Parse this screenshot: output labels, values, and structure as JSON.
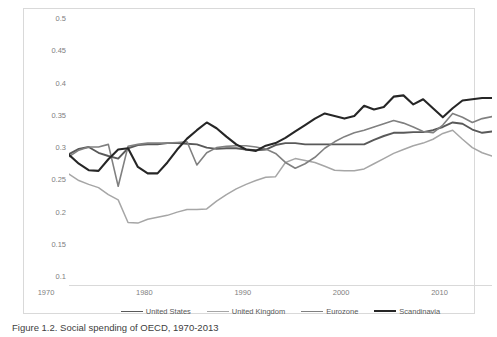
{
  "caption": "Figure 1.2. Social spending of OECD, 1970-2013",
  "legend": {
    "position": "bottom-center",
    "items": [
      {
        "label": "United States",
        "color": "#595959",
        "width": 1.9
      },
      {
        "label": "United Kingdom",
        "color": "#a6a6a6",
        "width": 1.5
      },
      {
        "label": "Eurozone",
        "color": "#808080",
        "width": 1.6
      },
      {
        "label": "Scandinavia",
        "color": "#262626",
        "width": 2.1
      }
    ]
  },
  "chart_data": {
    "type": "line",
    "title": "",
    "xlabel": "",
    "ylabel": "",
    "xlim": [
      1970,
      2013
    ],
    "ylim": [
      0.1,
      0.5
    ],
    "ytick_step": 0.05,
    "grid": false,
    "legend_position": "bottom-center",
    "ytick_labels": [
      "0.5",
      "0.45",
      "0.4",
      "0.35",
      "0.3",
      "0.25",
      "0.2",
      "0.15",
      "0.1"
    ],
    "ytick_values": [
      0.5,
      0.45,
      0.4,
      0.35,
      0.3,
      0.25,
      0.2,
      0.15,
      0.1
    ],
    "xtick_labels": [
      "1970",
      "1980",
      "1990",
      "2000",
      "2010"
    ],
    "xtick_values": [
      1970,
      1980,
      1990,
      2000,
      2010
    ],
    "x": [
      1970,
      1971,
      1972,
      1973,
      1974,
      1975,
      1976,
      1977,
      1978,
      1979,
      1980,
      1981,
      1982,
      1983,
      1984,
      1985,
      1986,
      1987,
      1988,
      1989,
      1990,
      1991,
      1992,
      1993,
      1994,
      1995,
      1996,
      1997,
      1998,
      1999,
      2000,
      2001,
      2002,
      2003,
      2004,
      2005,
      2006,
      2007,
      2008,
      2009,
      2010,
      2011,
      2012,
      2013
    ],
    "series": [
      {
        "name": "United States",
        "color": "#595959",
        "values": [
          0.303,
          0.311,
          0.314,
          0.305,
          0.3,
          0.296,
          0.312,
          0.317,
          0.318,
          0.318,
          0.32,
          0.32,
          0.319,
          0.318,
          0.313,
          0.311,
          0.312,
          0.312,
          0.31,
          0.309,
          0.31,
          0.317,
          0.32,
          0.32,
          0.318,
          0.318,
          0.318,
          0.318,
          0.318,
          0.318,
          0.318,
          0.325,
          0.331,
          0.336,
          0.336,
          0.337,
          0.337,
          0.34,
          0.345,
          0.352,
          0.35,
          0.341,
          0.336,
          0.338
        ]
      },
      {
        "name": "United Kingdom",
        "color": "#a6a6a6",
        "values": [
          0.272,
          0.262,
          0.256,
          0.251,
          0.24,
          0.232,
          0.197,
          0.196,
          0.202,
          0.205,
          0.208,
          0.213,
          0.217,
          0.217,
          0.218,
          0.23,
          0.24,
          0.249,
          0.256,
          0.262,
          0.267,
          0.268,
          0.29,
          0.296,
          0.293,
          0.29,
          0.284,
          0.278,
          0.277,
          0.277,
          0.28,
          0.288,
          0.296,
          0.304,
          0.31,
          0.316,
          0.32,
          0.326,
          0.335,
          0.34,
          0.326,
          0.313,
          0.305,
          0.3
        ]
      },
      {
        "name": "Eurozone",
        "color": "#808080",
        "values": [
          0.299,
          0.309,
          0.314,
          0.314,
          0.318,
          0.253,
          0.315,
          0.318,
          0.32,
          0.32,
          0.32,
          0.321,
          0.322,
          0.286,
          0.305,
          0.313,
          0.315,
          0.316,
          0.316,
          0.314,
          0.311,
          0.304,
          0.29,
          0.281,
          0.288,
          0.298,
          0.312,
          0.322,
          0.33,
          0.336,
          0.34,
          0.345,
          0.35,
          0.355,
          0.351,
          0.345,
          0.338,
          0.336,
          0.348,
          0.366,
          0.36,
          0.352,
          0.358,
          0.361
        ]
      },
      {
        "name": "Scandinavia",
        "color": "#262626",
        "values": [
          0.302,
          0.288,
          0.278,
          0.277,
          0.295,
          0.31,
          0.312,
          0.283,
          0.273,
          0.273,
          0.29,
          0.31,
          0.327,
          0.34,
          0.352,
          0.343,
          0.33,
          0.318,
          0.31,
          0.308,
          0.316,
          0.32,
          0.328,
          0.338,
          0.348,
          0.358,
          0.366,
          0.362,
          0.358,
          0.362,
          0.378,
          0.372,
          0.376,
          0.392,
          0.394,
          0.38,
          0.388,
          0.374,
          0.36,
          0.374,
          0.386,
          0.388,
          0.39,
          0.39
        ]
      }
    ]
  }
}
